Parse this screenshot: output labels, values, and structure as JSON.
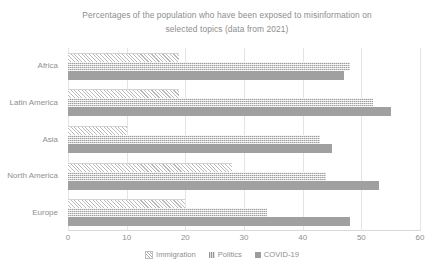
{
  "chart_data": {
    "type": "bar",
    "orientation": "horizontal",
    "title": "Percentages of the population who have been exposed to misinformation on selected topics (data from 2021)",
    "title_line_1": "Percentages of the population who have been exposed to misinformation on",
    "title_line_2": "selected topics (data from 2021)",
    "xlabel": "",
    "ylabel": "",
    "xlim": [
      0,
      60
    ],
    "ylim": null,
    "xticks": [
      0,
      10,
      20,
      30,
      40,
      50,
      60
    ],
    "xtick_labels": [
      "0",
      "10",
      "20",
      "30",
      "40",
      "50",
      "60"
    ],
    "categories": [
      "Africa",
      "Latin America",
      "Asia",
      "North America",
      "Europe"
    ],
    "grid": "vertical",
    "legend_position": "bottom",
    "series": [
      {
        "name": "Immigration",
        "pattern": "diagonal-hatch",
        "color": "#fbfbfb",
        "values": [
          19,
          19,
          10,
          28,
          20
        ]
      },
      {
        "name": "Politics",
        "pattern": "fine-dotted",
        "color": "#d2d2d2",
        "values": [
          48,
          52,
          43,
          44,
          34
        ]
      },
      {
        "name": "COVID-19",
        "pattern": "solid",
        "color": "#a0a0a0",
        "values": [
          47,
          55,
          45,
          53,
          48
        ]
      }
    ]
  },
  "legend": {
    "items": [
      {
        "label": "Immigration",
        "key": "s-immigration"
      },
      {
        "label": "Politics",
        "key": "s-politics"
      },
      {
        "label": "COVID-19",
        "key": "s-covid"
      }
    ]
  },
  "colors": {
    "text": "#8f8f8f",
    "gridline": "#e4e4e4",
    "axis": "#d9d9d9",
    "series_immigration": "#fbfbfb",
    "series_politics": "#d2d2d2",
    "series_covid": "#a0a0a0"
  }
}
